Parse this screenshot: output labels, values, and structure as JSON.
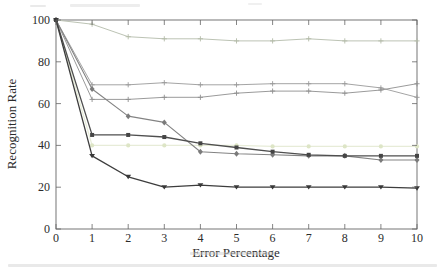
{
  "page": {
    "background_color": "#ffffff"
  },
  "artifacts": {
    "description": "faint cropped-text smudges at top and bottom edges and a light gray band at the bottom of the crop",
    "band_color": "#e9e9e9",
    "smudge_color": "#d8d8d8"
  },
  "chart_data": {
    "type": "line",
    "title": "",
    "xlabel": "Error Percentage",
    "ylabel": "Recognition Rate",
    "x": [
      0,
      1,
      2,
      3,
      4,
      5,
      6,
      7,
      8,
      9,
      10
    ],
    "xticks": [
      0,
      1,
      2,
      3,
      4,
      5,
      6,
      7,
      8,
      9,
      10
    ],
    "yticks": [
      0,
      20,
      40,
      60,
      80,
      100
    ],
    "xlim": [
      0,
      10
    ],
    "ylim": [
      0,
      100
    ],
    "grid": false,
    "box": true,
    "legend": "none",
    "axis_color": "#666666",
    "tick_label_color": "#2b2b2b",
    "series": [
      {
        "id": "pale-circle-line",
        "color": "#e7ecd8",
        "marker": "circle",
        "marker_color": "#dde5c6",
        "line_width": 1.2,
        "values": [
          100,
          40,
          40,
          40,
          40,
          40,
          39.5,
          39.5,
          39.5,
          39.5,
          39.5
        ]
      },
      {
        "id": "light-sage-plus-line",
        "color": "#bcc3b4",
        "marker": "plus",
        "marker_color": "#b2baa7",
        "line_width": 1.0,
        "values": [
          100,
          98,
          92,
          91,
          91,
          90,
          90,
          91,
          90,
          90,
          90
        ]
      },
      {
        "id": "gray-plus-line-upper",
        "color": "#9a9a9a",
        "marker": "plus",
        "marker_color": "#9a9a9a",
        "line_width": 0.9,
        "values": [
          100,
          69,
          69,
          70,
          69,
          69,
          69.5,
          69.5,
          69.5,
          67.5,
          63
        ]
      },
      {
        "id": "gray-plus-line-lower",
        "color": "#8e8e8e",
        "marker": "plus",
        "marker_color": "#8e8e8e",
        "line_width": 0.9,
        "values": [
          100,
          62,
          62,
          63,
          63,
          65,
          66,
          66,
          65,
          66.5,
          69.5
        ]
      },
      {
        "id": "gray-diamond-line",
        "color": "#838383",
        "marker": "diamond",
        "marker_color": "#7b7b7b",
        "line_width": 1.1,
        "values": [
          100,
          67,
          54,
          51,
          37,
          36,
          35.5,
          35,
          35,
          33,
          33
        ]
      },
      {
        "id": "dark-square-line",
        "color": "#4f4f4f",
        "marker": "square",
        "marker_color": "#454545",
        "line_width": 1.3,
        "values": [
          100,
          45,
          45,
          44,
          41,
          39,
          37,
          35.5,
          35,
          35,
          35
        ]
      },
      {
        "id": "dark-triangle-line",
        "color": "#3d3d3d",
        "marker": "triangle-down",
        "marker_color": "#383838",
        "line_width": 1.3,
        "values": [
          100,
          35,
          25,
          20,
          21,
          20,
          20,
          20,
          20,
          20,
          19.5
        ]
      }
    ]
  }
}
